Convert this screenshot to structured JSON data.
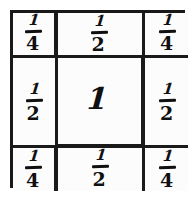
{
  "figure": {
    "ink_color": "#101010",
    "paper_color": "#fcfcfc",
    "border_color": "#181818"
  },
  "grid": {
    "rows": 3,
    "columns": 3,
    "cells": [
      {
        "row": 1,
        "col": 1,
        "type": "fraction",
        "numerator": "1",
        "denominator": "4",
        "value": "1/4"
      },
      {
        "row": 1,
        "col": 2,
        "type": "fraction",
        "numerator": "1",
        "denominator": "2",
        "value": "1/2"
      },
      {
        "row": 1,
        "col": 3,
        "type": "fraction",
        "numerator": "1",
        "denominator": "4",
        "value": "1/4"
      },
      {
        "row": 2,
        "col": 1,
        "type": "fraction",
        "numerator": "1",
        "denominator": "2",
        "value": "1/2"
      },
      {
        "row": 2,
        "col": 2,
        "type": "whole",
        "whole": "1",
        "value": "1"
      },
      {
        "row": 2,
        "col": 3,
        "type": "fraction",
        "numerator": "1",
        "denominator": "2",
        "value": "1/2"
      },
      {
        "row": 3,
        "col": 1,
        "type": "fraction",
        "numerator": "1",
        "denominator": "4",
        "value": "1/4"
      },
      {
        "row": 3,
        "col": 2,
        "type": "fraction",
        "numerator": "1",
        "denominator": "2",
        "value": "1/2"
      },
      {
        "row": 3,
        "col": 3,
        "type": "fraction",
        "numerator": "1",
        "denominator": "4",
        "value": "1/4"
      }
    ]
  }
}
